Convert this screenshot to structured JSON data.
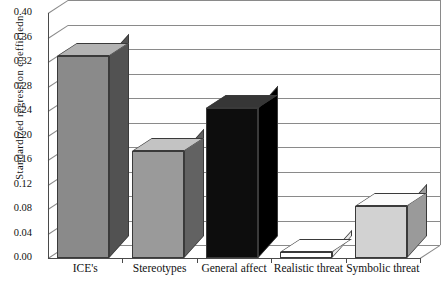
{
  "chart_data": {
    "type": "bar",
    "title": "",
    "subtitle": "",
    "xlabel": "",
    "ylabel": "Standardized regression coefficiedn",
    "categories": [
      "ICE's",
      "Stereotypes",
      "General affect",
      "Realistic threat",
      "Symbolic threat"
    ],
    "values": [
      0.33,
      0.175,
      0.245,
      0.01,
      0.085
    ],
    "series": [
      {
        "name": "Standardized regression coefficient",
        "values": [
          0.33,
          0.175,
          0.245,
          0.01,
          0.085
        ]
      }
    ],
    "ylim": [
      0.0,
      0.4
    ],
    "ytick_labels": [
      "0.40",
      "0.36",
      "0.32",
      "0.28",
      "0.24",
      "0.20",
      "0.16",
      "0.12",
      "0.08",
      "0.04",
      "0.00"
    ],
    "ytick_values": [
      0.4,
      0.36,
      0.32,
      0.28,
      0.24,
      0.2,
      0.16,
      0.12,
      0.08,
      0.04,
      0.0
    ],
    "ytick_step": 0.04,
    "grid": true,
    "legend": false,
    "legend_position": "none",
    "style": "3d-column",
    "bar_colors": [
      "#8a8a8a",
      "#9a9a9a",
      "#0d0d0d",
      "#ffffff",
      "#d2d2d2"
    ],
    "annotations": []
  },
  "axis": {
    "y_title": "Standardized regression coefficiedn",
    "ticks": [
      {
        "label": "0.40"
      },
      {
        "label": "0.36"
      },
      {
        "label": "0.32"
      },
      {
        "label": "0.28"
      },
      {
        "label": "0.24"
      },
      {
        "label": "0.20"
      },
      {
        "label": "0.16"
      },
      {
        "label": "0.12"
      },
      {
        "label": "0.08"
      },
      {
        "label": "0.04"
      },
      {
        "label": "0.00"
      }
    ]
  },
  "categories": [
    {
      "label": "ICE's"
    },
    {
      "label": "Stereotypes"
    },
    {
      "label": "General affect"
    },
    {
      "label": "Realistic threat"
    },
    {
      "label": "Symbolic threat"
    }
  ]
}
